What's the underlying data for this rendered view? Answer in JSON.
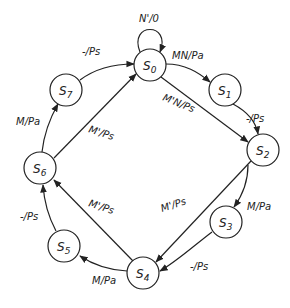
{
  "diagram": {
    "type": "state-diagram",
    "nodes": [
      {
        "id": "S0",
        "label": "S0",
        "main": "S",
        "sub": "0",
        "x": 150,
        "y": 65
      },
      {
        "id": "S1",
        "label": "S1",
        "main": "S",
        "sub": "1",
        "x": 225,
        "y": 90
      },
      {
        "id": "S2",
        "label": "S2",
        "main": "S",
        "sub": "2",
        "x": 263,
        "y": 150
      },
      {
        "id": "S3",
        "label": "S3",
        "main": "S",
        "sub": "3",
        "x": 226,
        "y": 222
      },
      {
        "id": "S4",
        "label": "S4",
        "main": "S",
        "sub": "4",
        "x": 143,
        "y": 273
      },
      {
        "id": "S5",
        "label": "S5",
        "main": "S",
        "sub": "5",
        "x": 64,
        "y": 246
      },
      {
        "id": "S6",
        "label": "S6",
        "main": "S",
        "sub": "6",
        "x": 40,
        "y": 168
      },
      {
        "id": "S7",
        "label": "S7",
        "main": "S",
        "sub": "7",
        "x": 66,
        "y": 90
      }
    ],
    "edges": [
      {
        "from": "S0",
        "to": "S0",
        "label": "N'/0"
      },
      {
        "from": "S0",
        "to": "S1",
        "label": "MN/Pa"
      },
      {
        "from": "S1",
        "to": "S2",
        "label": "-/Ps"
      },
      {
        "from": "S0",
        "to": "S2",
        "label": "M'N/Ps"
      },
      {
        "from": "S2",
        "to": "S3",
        "label": "M/Pa"
      },
      {
        "from": "S2",
        "to": "S4",
        "label": "M'/Ps"
      },
      {
        "from": "S3",
        "to": "S4",
        "label": "-/Ps"
      },
      {
        "from": "S4",
        "to": "S5",
        "label": "M/Pa"
      },
      {
        "from": "S4",
        "to": "S6",
        "label": "M'/Ps"
      },
      {
        "from": "S5",
        "to": "S6",
        "label": "-/Ps"
      },
      {
        "from": "S6",
        "to": "S7",
        "label": "M/Pa"
      },
      {
        "from": "S6",
        "to": "S0",
        "label": "M'/Ps"
      },
      {
        "from": "S7",
        "to": "S0",
        "label": "-/Ps"
      }
    ]
  },
  "labels": {
    "self_loop": "N'/0",
    "s0_s1": "MN/Pa",
    "s1_s2": "-/Ps",
    "s0_s2": "M'N/Ps",
    "s2_s3": "M/Pa",
    "s2_s4": "M'/Ps",
    "s3_s4": "-/Ps",
    "s4_s5": "M/Pa",
    "s4_s6": "M'/Ps",
    "s5_s6": "-/Ps",
    "s6_s7": "M/Pa",
    "s6_s0": "M'/Ps",
    "s7_s0": "-/Ps"
  },
  "node_text": {
    "S0": {
      "main": "S",
      "sub": "0"
    },
    "S1": {
      "main": "S",
      "sub": "1"
    },
    "S2": {
      "main": "S",
      "sub": "2"
    },
    "S3": {
      "main": "S",
      "sub": "3"
    },
    "S4": {
      "main": "S",
      "sub": "4"
    },
    "S5": {
      "main": "S",
      "sub": "5"
    },
    "S6": {
      "main": "S",
      "sub": "6"
    },
    "S7": {
      "main": "S",
      "sub": "7"
    }
  }
}
